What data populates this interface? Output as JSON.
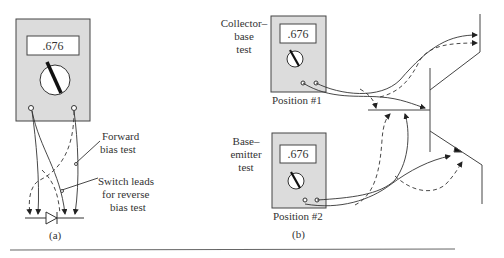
{
  "figure": {
    "panel_a": {
      "caption": "(a)",
      "meter": {
        "reading": ".676"
      },
      "labels": {
        "forward_line1": "Forward",
        "forward_line2": "bias test",
        "switch_line1": "Switch leads",
        "switch_line2": "for reverse",
        "switch_line3": "bias test"
      }
    },
    "panel_b": {
      "caption": "(b)",
      "meter1": {
        "reading": ".676",
        "position_label": "Position #1",
        "test_line1": "Collector–",
        "test_line2": "base",
        "test_line3": "test"
      },
      "meter2": {
        "reading": ".676",
        "position_label": "Position #2",
        "test_line1": "Base–",
        "test_line2": "emitter",
        "test_line3": "test"
      }
    }
  },
  "colors": {
    "meter_fill": "#dcdcdc",
    "stroke": "#333333",
    "display_fill": "#ffffff"
  }
}
